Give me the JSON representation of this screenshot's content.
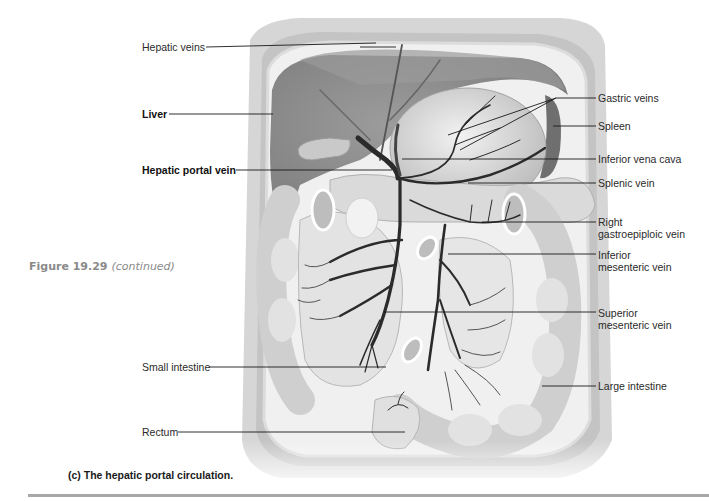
{
  "figure": {
    "number": "Figure 19.29",
    "continued": "(continued)",
    "caption": "(c) The hepatic portal circulation."
  },
  "labels": {
    "left": [
      {
        "id": "hepatic-veins",
        "text": "Hepatic veins",
        "bold": false
      },
      {
        "id": "liver",
        "text": "Liver",
        "bold": true
      },
      {
        "id": "hepatic-portal-vein",
        "text": "Hepatic portal vein",
        "bold": true
      },
      {
        "id": "small-intestine",
        "text": "Small intestine",
        "bold": false
      },
      {
        "id": "rectum",
        "text": "Rectum",
        "bold": false
      }
    ],
    "right": [
      {
        "id": "gastric-veins",
        "text": "Gastric veins"
      },
      {
        "id": "spleen",
        "text": "Spleen"
      },
      {
        "id": "inferior-vena-cava",
        "text": "Inferior vena cava"
      },
      {
        "id": "splenic-vein",
        "text": "Splenic vein"
      },
      {
        "id": "right-gastroepiploic-vein",
        "text": "Right\ngastroepiploic vein"
      },
      {
        "id": "inferior-mesenteric-vein",
        "text": "Inferior\nmesenteric vein"
      },
      {
        "id": "superior-mesenteric-vein",
        "text": "Superior\nmesenteric vein"
      },
      {
        "id": "large-intestine",
        "text": "Large intestine"
      }
    ]
  },
  "colors": {
    "background": "#ffffff",
    "leader_line": "#1a1a1a",
    "vein": "#2b2b2b",
    "tissue_dark": "#8c8c8c",
    "tissue_mid": "#b9b9b9",
    "tissue_light": "#dedede",
    "figure_number": "#8a8a8a",
    "rule": "#a8a8a8"
  }
}
